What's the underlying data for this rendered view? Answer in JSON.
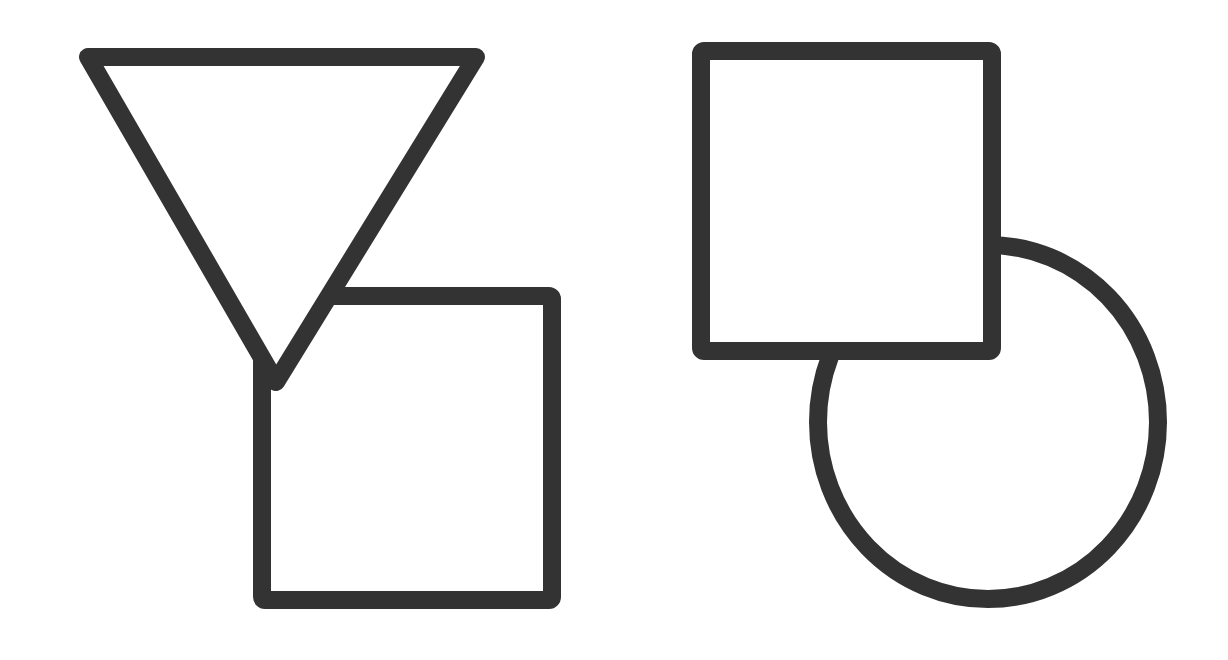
{
  "diagram": {
    "background": "#ffffff",
    "stroke_color": "#333333",
    "stroke_width": 18,
    "figures": [
      {
        "id": "left-figure",
        "shapes": [
          {
            "type": "triangle",
            "orientation": "inverted",
            "points": [
              [
                88,
                57
              ],
              [
                476,
                57
              ],
              [
                276,
                382
              ]
            ]
          },
          {
            "type": "square",
            "x": 262,
            "y": 296,
            "width": 290,
            "height": 304
          }
        ]
      },
      {
        "id": "right-figure",
        "shapes": [
          {
            "type": "square",
            "x": 701,
            "y": 51,
            "width": 291,
            "height": 300
          },
          {
            "type": "circle",
            "cx": 988,
            "cy": 422,
            "rx": 170,
            "ry": 177
          }
        ]
      }
    ]
  }
}
